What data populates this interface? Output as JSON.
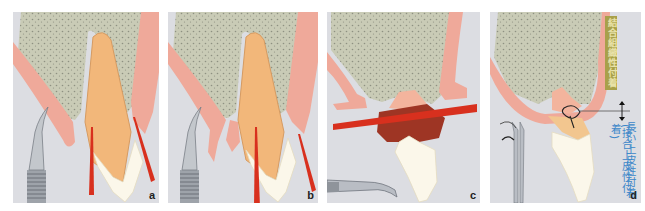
{
  "figure": {
    "panels": [
      {
        "id": "a",
        "label": "a",
        "instrument": "scalpel",
        "description": "Incisions along gingival sulcus on both sides of root"
      },
      {
        "id": "b",
        "label": "b",
        "instrument": "scalpel",
        "description": "Gingiva reflected, incisions deepened along root"
      },
      {
        "id": "c",
        "label": "c",
        "instrument": "extraction forceps",
        "description": "Extrusion of tooth; red line marks new level"
      },
      {
        "id": "d",
        "label": "d",
        "instrument": "needle holder",
        "description": "Suture placed; attachment types labeled"
      }
    ],
    "annotations": {
      "connective_tissue_attachment": "結合組織性付着",
      "long_epithelial_attachment": "長い上皮性付着",
      "junctional_epithelial_attachment": "(接合上皮性付着)"
    },
    "colors": {
      "background": "#dcdde2",
      "bone": "#c9cbb6",
      "gingiva": "#efa99a",
      "root": "#f2b77a",
      "crown": "#fbf7ea",
      "incision": "#d8301e",
      "granulation": "#9e3524",
      "olive_label": "#a8a04a",
      "blue_label": "#3d87c9"
    }
  }
}
